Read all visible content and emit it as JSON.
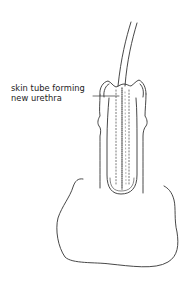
{
  "figure": {
    "type": "surgical line illustration",
    "annotations": [
      {
        "id": "skin-tube-label",
        "lines": [
          "skin tube forming",
          "new urethra"
        ]
      }
    ],
    "colors": {
      "line": "#333333",
      "dotted": "#555555",
      "background": "#ffffff"
    }
  }
}
